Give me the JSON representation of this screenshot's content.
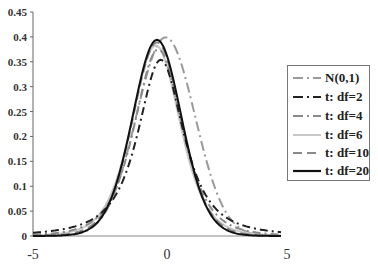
{
  "chart_data": {
    "type": "line",
    "title": "",
    "xlabel": "",
    "ylabel": "",
    "xlim": [
      -5,
      5
    ],
    "ylim": [
      0,
      0.45
    ],
    "grid": false,
    "legend_position": "right",
    "x_ticks": [
      "-5",
      "0",
      "5"
    ],
    "y_ticks": [
      "0",
      "0.05",
      "0.1",
      "0.15",
      "0.2",
      "0.25",
      "0.3",
      "0.35",
      "0.4",
      "0.45"
    ],
    "series": [
      {
        "name": "N(0,1)",
        "dist": "normal",
        "df": null,
        "peak": 0.399,
        "color": "#9a9a9a",
        "dash": "10,4,2,4",
        "width": 2,
        "shift": 0.35,
        "scale": 1.18
      },
      {
        "name": "t: df=2",
        "dist": "t",
        "df": 2,
        "peak": 0.354,
        "color": "#222222",
        "dash": "8,4,2,4",
        "width": 2,
        "shift": 0.15,
        "scale": 1.0
      },
      {
        "name": "t: df=4",
        "dist": "t",
        "df": 4,
        "peak": 0.375,
        "color": "#8a8a8a",
        "dash": "8,4,2,4",
        "width": 2,
        "shift": 0.05,
        "scale": 1.0
      },
      {
        "name": "t: df=6",
        "dist": "t",
        "df": 6,
        "peak": 0.383,
        "color": "#c8c8c8",
        "dash": "",
        "width": 2,
        "shift": -0.05,
        "scale": 1.0
      },
      {
        "name": "t: df=10",
        "dist": "t",
        "df": 10,
        "peak": 0.389,
        "color": "#8a8a8a",
        "dash": "9,5",
        "width": 2,
        "shift": 0.0,
        "scale": 1.0
      },
      {
        "name": "t: df=20",
        "dist": "t",
        "df": 20,
        "peak": 0.394,
        "color": "#111111",
        "dash": "",
        "width": 2,
        "shift": 0.0,
        "scale": 1.0
      }
    ]
  },
  "legend": {
    "items": [
      "N(0,1)",
      "t: df=2",
      "t: df=4",
      "t: df=6",
      "t: df=10",
      "t: df=20"
    ]
  }
}
